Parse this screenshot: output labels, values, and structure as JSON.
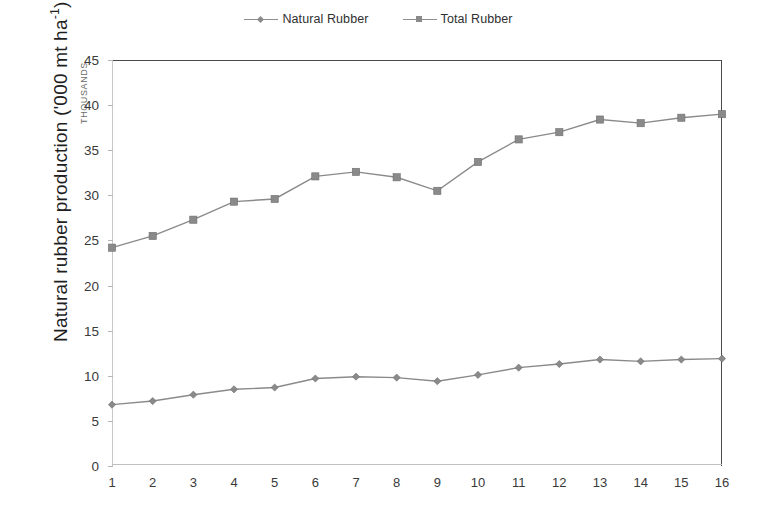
{
  "legend": {
    "position": "top-center",
    "entries": [
      {
        "label": "Natural Rubber",
        "marker": "diamond",
        "color": "#8a8a8a"
      },
      {
        "label": "Total Rubber",
        "marker": "square",
        "color": "#8a8a8a"
      }
    ]
  },
  "axes": {
    "ylabel_prefix": "Natural rubber production ('000 mt ha",
    "ylabel_sup": "-1",
    "ylabel_suffix": ")",
    "ylabel_full": "Natural rubber production ('000 mt ha-1)",
    "y_unit_note": "THOUSANDS",
    "xlabel": ""
  },
  "chart_data": {
    "type": "line",
    "title": "",
    "subtitle": "",
    "xlabel": "",
    "ylabel": "Natural rubber production ('000 mt ha-1)",
    "y_unit_note": "THOUSANDS",
    "x": [
      1,
      2,
      3,
      4,
      5,
      6,
      7,
      8,
      9,
      10,
      11,
      12,
      13,
      14,
      15,
      16
    ],
    "xticklabels": [
      "1",
      "2",
      "3",
      "4",
      "5",
      "6",
      "7",
      "8",
      "9",
      "10",
      "11",
      "12",
      "13",
      "14",
      "15",
      "16"
    ],
    "yticklabels": [
      "0",
      "5",
      "10",
      "15",
      "20",
      "25",
      "30",
      "35",
      "40",
      "45"
    ],
    "yticks": [
      0,
      5,
      10,
      15,
      20,
      25,
      30,
      35,
      40,
      45
    ],
    "xlim": [
      1,
      16
    ],
    "ylim": [
      0,
      45
    ],
    "grid": false,
    "legend_position": "top-center",
    "series": [
      {
        "name": "Natural Rubber",
        "marker": "diamond",
        "color": "#8a8a8a",
        "values": [
          6.8,
          7.2,
          7.9,
          8.5,
          8.7,
          9.7,
          9.9,
          9.8,
          9.4,
          10.1,
          10.9,
          11.3,
          11.8,
          11.6,
          11.8,
          11.9
        ]
      },
      {
        "name": "Total Rubber",
        "marker": "square",
        "color": "#8a8a8a",
        "values": [
          24.2,
          25.5,
          27.3,
          29.3,
          29.6,
          32.1,
          32.6,
          32.0,
          30.5,
          33.7,
          36.2,
          37.0,
          38.4,
          38.0,
          38.6,
          39.0
        ]
      }
    ]
  }
}
